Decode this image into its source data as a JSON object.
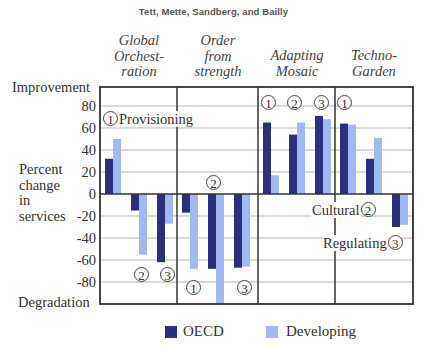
{
  "header": {
    "authors": "Tett, Mette, Sandberg, and Bailly"
  },
  "axis": {
    "top_label": "Improvement",
    "bottom_label": "Degradation",
    "ylabel_lines": [
      "Percent",
      "change",
      "in",
      "services"
    ],
    "ticks": [
      "80",
      "60",
      "40",
      "20",
      "0",
      "-20",
      "-40",
      "-60",
      "-80"
    ]
  },
  "scenarios": [
    {
      "lines": [
        "Global",
        "Orchest-",
        "ration"
      ]
    },
    {
      "lines": [
        "Order",
        "from",
        "strength"
      ]
    },
    {
      "lines": [
        "Adapting",
        "Mosaic"
      ]
    },
    {
      "lines": [
        "Techno-",
        "Garden"
      ]
    }
  ],
  "annotations": {
    "provisioning": "Provisioning",
    "cultural": "Cultural",
    "regulating": "Regulating",
    "num1": "1",
    "num2": "2",
    "num3": "3"
  },
  "legend": {
    "oecd": {
      "label": "OECD",
      "color": "#2b2f7d"
    },
    "developing": {
      "label": "Developing",
      "color": "#9fbaf1"
    }
  },
  "chart_data": {
    "type": "bar",
    "title": "",
    "xlabel": "",
    "ylabel": "Percent change in services",
    "ylim": [
      -100,
      100
    ],
    "yticks": [
      -80,
      -60,
      -40,
      -20,
      0,
      20,
      40,
      60,
      80
    ],
    "grid": true,
    "legend_position": "bottom",
    "panels": [
      "Global Orchestration",
      "Order from strength",
      "Adapting Mosaic",
      "TechnoGarden"
    ],
    "categories": [
      "Provisioning (1)",
      "Cultural (2)",
      "Regulating (3)"
    ],
    "series": [
      {
        "name": "OECD",
        "color": "#2b2f7d",
        "values": {
          "Global Orchestration": [
            32,
            -15,
            -62
          ],
          "Order from strength": [
            -17,
            -68,
            -67
          ],
          "Adapting Mosaic": [
            65,
            54,
            71
          ],
          "TechnoGarden": [
            64,
            32,
            -30
          ]
        }
      },
      {
        "name": "Developing",
        "color": "#9fbaf1",
        "values": {
          "Global Orchestration": [
            50,
            -55,
            -27
          ],
          "Order from strength": [
            -68,
            -100,
            -66
          ],
          "Adapting Mosaic": [
            17,
            65,
            68
          ],
          "TechnoGarden": [
            63,
            51,
            -28
          ]
        }
      }
    ],
    "annotations": [
      "(1) Provisioning",
      "(2) Cultural",
      "(3) Regulating"
    ],
    "y_extremes": {
      "top": "Improvement",
      "bottom": "Degradation"
    }
  }
}
